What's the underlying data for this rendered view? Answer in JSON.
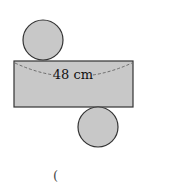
{
  "diagram": {
    "type": "cylinder-net",
    "fill_color": "#c8c8c8",
    "stroke_color": "#333333",
    "rectangle": {
      "label": "48 cm"
    },
    "circles": [
      "top-base",
      "bottom-base"
    ],
    "answer_paren": "("
  }
}
